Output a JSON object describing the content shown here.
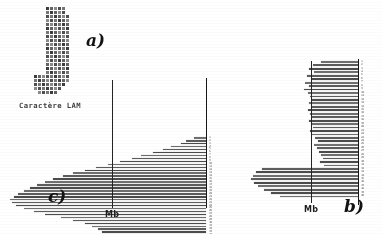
{
  "figure": {
    "panel_a": {
      "label": "a)",
      "caption": "Caractère LAM",
      "icon": "lam-character-bitmap"
    },
    "panel_c": {
      "label": "c)",
      "reference_line_label": "Mb"
    },
    "panel_b": {
      "label": "b)",
      "reference_line_label": "Mb"
    }
  },
  "chart_data": [
    {
      "id": "panel-c",
      "type": "bar",
      "orientation": "horizontal-left",
      "title": "c)",
      "xlabel": "",
      "ylabel": "",
      "annotations": [
        {
          "text": "Mb",
          "type": "reference-line",
          "x": 0.52
        }
      ],
      "axis_position": "right",
      "grid": false,
      "legend": null,
      "categories": [
        "1",
        "2",
        "3",
        "4",
        "5",
        "6",
        "7",
        "8",
        "9",
        "10",
        "11",
        "12",
        "13",
        "14",
        "15",
        "16",
        "17",
        "18",
        "19",
        "20",
        "21",
        "22",
        "23",
        "24",
        "25",
        "26",
        "27",
        "28",
        "29",
        "30",
        "31",
        "32",
        "33",
        "34",
        "35",
        "36",
        "37",
        "38"
      ],
      "values": [
        0.06,
        0.1,
        0.13,
        0.18,
        0.22,
        0.27,
        0.33,
        0.38,
        0.44,
        0.5,
        0.56,
        0.62,
        0.68,
        0.73,
        0.78,
        0.82,
        0.86,
        0.9,
        0.93,
        0.96,
        0.98,
        1.0,
        0.99,
        0.97,
        0.93,
        0.88,
        0.82,
        0.74,
        0.68,
        0.62,
        0.58,
        0.55,
        0.53,
        0.52,
        0.51,
        0.5,
        0.49,
        0.46
      ],
      "xlim": [
        0,
        1
      ]
    },
    {
      "id": "panel-b",
      "type": "bar",
      "orientation": "horizontal-left",
      "title": "b)",
      "xlabel": "",
      "ylabel": "",
      "annotations": [
        {
          "text": "Mb",
          "type": "reference-line",
          "x": 0.58
        }
      ],
      "axis_position": "right",
      "grid": false,
      "legend": null,
      "categories": [
        "1",
        "2",
        "3",
        "4",
        "5",
        "6",
        "7",
        "8",
        "9",
        "10",
        "11",
        "12",
        "13",
        "14",
        "15",
        "16",
        "17",
        "18",
        "19",
        "20",
        "21",
        "22",
        "23",
        "24",
        "25",
        "26",
        "27",
        "28",
        "29",
        "30",
        "31",
        "32",
        "33",
        "34",
        "35",
        "36",
        "37",
        "38",
        "39",
        "40"
      ],
      "values": [
        0.33,
        0.4,
        0.44,
        0.39,
        0.46,
        0.42,
        0.47,
        0.44,
        0.48,
        0.45,
        0.43,
        0.41,
        0.44,
        0.42,
        0.45,
        0.43,
        0.41,
        0.44,
        0.42,
        0.4,
        0.43,
        0.41,
        0.38,
        0.36,
        0.39,
        0.37,
        0.35,
        0.33,
        0.31,
        0.34,
        0.3,
        0.86,
        0.91,
        0.94,
        0.96,
        0.93,
        0.89,
        0.84,
        0.78,
        0.7
      ],
      "xlim": [
        0,
        1
      ]
    }
  ],
  "lam_bitmap": {
    "cols": 11,
    "rows": 22,
    "rle": [
      "00011111000",
      "00011111000",
      "00011111100",
      "00011111100",
      "00011111100",
      "00011111100",
      "00011111100",
      "00011111100",
      "00011111100",
      "00011111100",
      "00011111100",
      "00011111100",
      "00011111100",
      "00011111100",
      "00011111100",
      "00011111100",
      "00011111100",
      "11111111100",
      "11111111100",
      "11111111000",
      "11111110000",
      "01111100000"
    ]
  }
}
